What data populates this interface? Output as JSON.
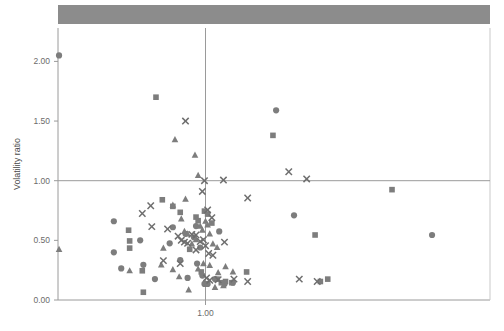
{
  "figure": {
    "title_partial": "",
    "header_bar_color": "#8c8c8c",
    "marker_color": "#7d7d7d",
    "axis_color": "#9a9a9a",
    "text_color": "#5a5a5a"
  },
  "axes": {
    "y_axis_label": "Volatility ratio",
    "y_ticks": [
      "0.00",
      "0.50",
      "1.00",
      "1.50",
      "2.00"
    ],
    "y_tick_values": [
      0.0,
      0.5,
      1.0,
      1.5,
      2.0
    ],
    "x_ticks": [
      "1.00"
    ],
    "x_tick_values": [
      1.0
    ],
    "x_axis_label": ""
  },
  "chart_data": {
    "type": "scatter",
    "title": "",
    "xlabel": "",
    "ylabel": "Volatility ratio",
    "xlim": [
      0.3,
      2.35
    ],
    "ylim": [
      0.0,
      2.28
    ],
    "grid": false,
    "legend": "none",
    "reference_lines": [
      {
        "orient": "horizontal",
        "value": 1.0
      },
      {
        "orient": "vertical",
        "value": 1.0
      }
    ],
    "series": [
      {
        "name": "circle",
        "marker": "circle",
        "points": [
          [
            0.305,
            2.05
          ],
          [
            0.565,
            0.66
          ],
          [
            0.565,
            0.4
          ],
          [
            0.6,
            0.265
          ],
          [
            0.69,
            0.5
          ],
          [
            0.705,
            0.295
          ],
          [
            0.76,
            0.175
          ],
          [
            0.83,
            0.475
          ],
          [
            0.845,
            0.61
          ],
          [
            0.88,
            0.335
          ],
          [
            0.905,
            0.555
          ],
          [
            0.915,
            0.185
          ],
          [
            0.945,
            0.525
          ],
          [
            0.955,
            0.62
          ],
          [
            0.96,
            0.305
          ],
          [
            0.975,
            0.44
          ],
          [
            0.985,
            0.205
          ],
          [
            0.995,
            0.135
          ],
          [
            1.01,
            0.135
          ],
          [
            1.045,
            0.175
          ],
          [
            1.065,
            0.575
          ],
          [
            1.09,
            0.135
          ],
          [
            1.13,
            0.145
          ],
          [
            1.335,
            1.59
          ],
          [
            1.42,
            0.71
          ],
          [
            2.075,
            0.545
          ]
        ]
      },
      {
        "name": "square",
        "marker": "square",
        "points": [
          [
            0.765,
            1.7
          ],
          [
            0.635,
            0.585
          ],
          [
            0.64,
            0.495
          ],
          [
            0.64,
            0.435
          ],
          [
            0.7,
            0.245
          ],
          [
            0.795,
            0.84
          ],
          [
            0.845,
            0.785
          ],
          [
            0.88,
            0.735
          ],
          [
            0.925,
            0.425
          ],
          [
            0.955,
            0.695
          ],
          [
            0.965,
            0.665
          ],
          [
            0.98,
            0.235
          ],
          [
            0.995,
            0.745
          ],
          [
            1.01,
            0.72
          ],
          [
            1.03,
            0.645
          ],
          [
            1.055,
            0.175
          ],
          [
            1.075,
            0.145
          ],
          [
            1.095,
            0.155
          ],
          [
            1.125,
            0.145
          ],
          [
            1.195,
            0.235
          ],
          [
            1.32,
            1.38
          ],
          [
            1.52,
            0.545
          ],
          [
            1.545,
            0.155
          ],
          [
            1.58,
            0.175
          ],
          [
            1.885,
            0.925
          ],
          [
            0.705,
            0.065
          ]
        ]
      },
      {
        "name": "triangle",
        "marker": "triangle",
        "points": [
          [
            0.305,
            0.425
          ],
          [
            0.855,
            1.345
          ],
          [
            0.95,
            1.215
          ],
          [
            0.965,
            1.045
          ],
          [
            0.905,
            0.845
          ],
          [
            0.845,
            0.795
          ],
          [
            0.885,
            0.68
          ],
          [
            0.9,
            0.575
          ],
          [
            0.915,
            0.555
          ],
          [
            0.935,
            0.47
          ],
          [
            0.955,
            0.505
          ],
          [
            0.975,
            0.62
          ],
          [
            0.985,
            0.585
          ],
          [
            1.0,
            0.66
          ],
          [
            1.01,
            0.63
          ],
          [
            1.02,
            0.555
          ],
          [
            1.035,
            0.47
          ],
          [
            1.055,
            0.44
          ],
          [
            0.8,
            0.435
          ],
          [
            0.79,
            0.295
          ],
          [
            0.845,
            0.255
          ],
          [
            0.875,
            0.195
          ],
          [
            0.92,
            0.085
          ],
          [
            0.965,
            0.26
          ],
          [
            0.99,
            0.305
          ],
          [
            1.02,
            0.29
          ],
          [
            1.045,
            0.105
          ],
          [
            1.06,
            0.23
          ],
          [
            1.085,
            0.12
          ],
          [
            1.095,
            0.28
          ],
          [
            1.13,
            0.235
          ],
          [
            0.64,
            0.245
          ]
        ]
      },
      {
        "name": "cross",
        "marker": "x",
        "points": [
          [
            0.905,
            1.5
          ],
          [
            0.995,
            1.0
          ],
          [
            1.085,
            1.005
          ],
          [
            1.395,
            1.075
          ],
          [
            1.48,
            1.015
          ],
          [
            1.2,
            0.855
          ],
          [
            0.985,
            0.91
          ],
          [
            1.01,
            0.755
          ],
          [
            1.03,
            0.69
          ],
          [
            0.74,
            0.79
          ],
          [
            0.7,
            0.725
          ],
          [
            0.745,
            0.615
          ],
          [
            0.82,
            0.595
          ],
          [
            0.87,
            0.535
          ],
          [
            0.885,
            0.5
          ],
          [
            0.9,
            0.485
          ],
          [
            0.915,
            0.475
          ],
          [
            0.935,
            0.55
          ],
          [
            0.955,
            0.545
          ],
          [
            0.975,
            0.49
          ],
          [
            0.99,
            0.505
          ],
          [
            1.0,
            0.455
          ],
          [
            1.015,
            0.39
          ],
          [
            1.035,
            0.375
          ],
          [
            1.09,
            0.485
          ],
          [
            0.8,
            0.33
          ],
          [
            0.88,
            0.305
          ],
          [
            0.955,
            0.42
          ],
          [
            1.005,
            0.185
          ],
          [
            1.02,
            0.165
          ],
          [
            1.06,
            0.17
          ],
          [
            1.135,
            0.175
          ],
          [
            1.2,
            0.155
          ],
          [
            1.445,
            0.175
          ],
          [
            1.53,
            0.155
          ]
        ]
      }
    ]
  }
}
